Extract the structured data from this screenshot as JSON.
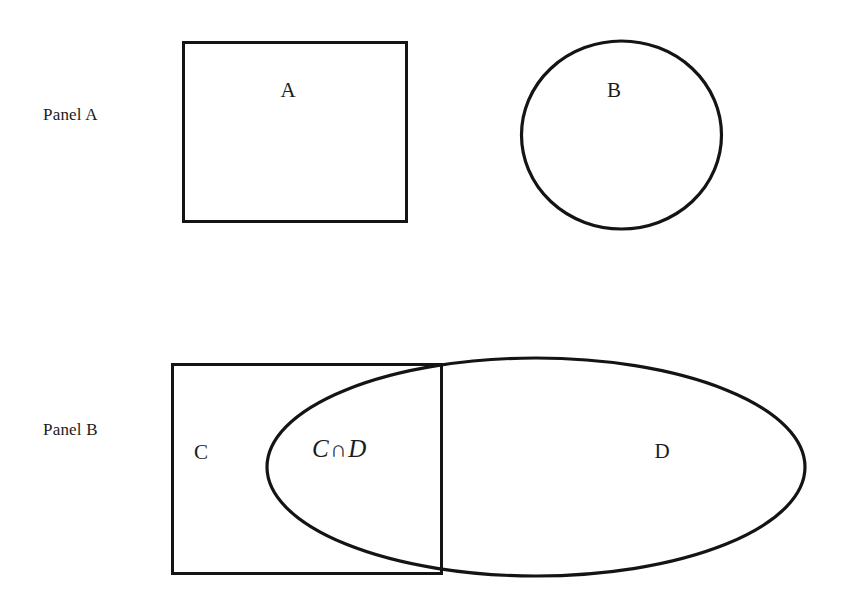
{
  "figure": {
    "width": 846,
    "height": 598,
    "background_color": "#ffffff",
    "stroke_color": "#141414",
    "text_color": "#1c1c1c"
  },
  "panels": [
    {
      "name": "Panel A",
      "label": "Panel A",
      "shapes": [
        {
          "id": "rect-a",
          "kind": "rectangle",
          "label": "A",
          "x": 182,
          "y": 41,
          "width": 226,
          "height": 182,
          "stroke_width": 3,
          "fill": "none"
        },
        {
          "id": "circle-b",
          "kind": "ellipse",
          "label": "B",
          "cx": 621.5,
          "cy": 135,
          "rx": 101,
          "ry": 95,
          "stroke_width": 3,
          "fill": "none"
        }
      ]
    },
    {
      "name": "Panel B",
      "label": "Panel B",
      "shapes": [
        {
          "id": "rect-c",
          "kind": "rectangle",
          "label": "C",
          "x": 171,
          "y": 363,
          "width": 272,
          "height": 212,
          "stroke_width": 3,
          "fill": "none"
        },
        {
          "id": "ellipse-d",
          "kind": "ellipse",
          "label": "D",
          "cx": 536,
          "cy": 467,
          "rx": 270,
          "ry": 110,
          "stroke_width": 3,
          "fill": "none"
        }
      ],
      "intersection_label": {
        "left_operand": "C",
        "operator": "∩",
        "right_operand": "D",
        "text": "C∩D",
        "style": "italic"
      }
    }
  ],
  "labels": {
    "panel_a": "Panel A",
    "panel_b": "Panel B",
    "a": "A",
    "b": "B",
    "c": "C",
    "d": "D",
    "cd_left": "C",
    "cd_operator": "∩",
    "cd_right": "D"
  }
}
